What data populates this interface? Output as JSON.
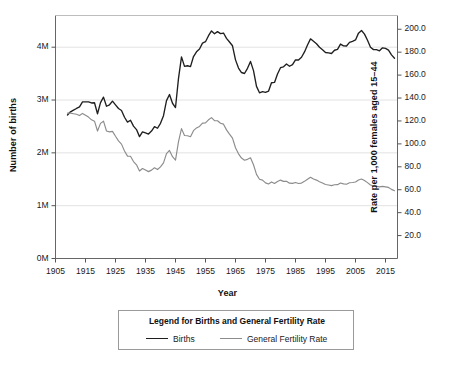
{
  "chart_data": {
    "type": "line",
    "title": "",
    "xlabel": "Year",
    "ylabel": "Number of births",
    "ylabel_right": "Rate per 1,000 females aged 15–44",
    "grid": true,
    "legend_position": "below-plot",
    "legend_title": "Legend for Births and General Fertility Rate",
    "xlim": [
      1905,
      2019
    ],
    "xticks": [
      1905,
      1915,
      1925,
      1935,
      1945,
      1955,
      1965,
      1975,
      1985,
      1995,
      2005,
      2015
    ],
    "xticklabels": [
      "1905",
      "1915",
      "1925",
      "1935",
      "1945",
      "1955",
      "1965",
      "1975",
      "1985",
      "1995",
      "2005",
      "2015"
    ],
    "ylim_left": [
      0,
      4600000
    ],
    "yticks_left": [
      0,
      1000000,
      2000000,
      3000000,
      4000000
    ],
    "yticklabels_left": [
      "0M",
      "1M",
      "2M",
      "3M",
      "4M"
    ],
    "ylim_right": [
      0,
      212
    ],
    "yticks_right": [
      20,
      40,
      60,
      80,
      100,
      120,
      140,
      160,
      180,
      200
    ],
    "yticklabels_right": [
      "20.0",
      "40.0",
      "60.0",
      "80.0",
      "100.0",
      "120.0",
      "140.0",
      "160.0",
      "180.0",
      "200.0"
    ],
    "gridlines_left": [
      1000000,
      2000000,
      3000000,
      4000000
    ],
    "series": [
      {
        "name": "Births",
        "axis": "left",
        "color": "#1f1f1f",
        "x": [
          1909,
          1910,
          1911,
          1912,
          1913,
          1914,
          1915,
          1916,
          1917,
          1918,
          1919,
          1920,
          1921,
          1922,
          1923,
          1924,
          1925,
          1926,
          1927,
          1928,
          1929,
          1930,
          1931,
          1932,
          1933,
          1934,
          1935,
          1936,
          1937,
          1938,
          1939,
          1940,
          1941,
          1942,
          1943,
          1944,
          1945,
          1946,
          1947,
          1948,
          1949,
          1950,
          1951,
          1952,
          1953,
          1954,
          1955,
          1956,
          1957,
          1958,
          1959,
          1960,
          1961,
          1962,
          1963,
          1964,
          1965,
          1966,
          1967,
          1968,
          1969,
          1970,
          1971,
          1972,
          1973,
          1974,
          1975,
          1976,
          1977,
          1978,
          1979,
          1980,
          1981,
          1982,
          1983,
          1984,
          1985,
          1986,
          1987,
          1988,
          1989,
          1990,
          1991,
          1992,
          1993,
          1994,
          1995,
          1996,
          1997,
          1998,
          1999,
          2000,
          2001,
          2002,
          2003,
          2004,
          2005,
          2006,
          2007,
          2008,
          2009,
          2010,
          2011,
          2012,
          2013,
          2014,
          2015,
          2016,
          2017,
          2018
        ],
        "values": [
          2718000,
          2777000,
          2809000,
          2840000,
          2869000,
          2966000,
          2965000,
          2964000,
          2944000,
          2948000,
          2740000,
          2950000,
          3055000,
          2882000,
          2910000,
          2979000,
          2909000,
          2839000,
          2802000,
          2674000,
          2582000,
          2618000,
          2506000,
          2440000,
          2307000,
          2396000,
          2377000,
          2355000,
          2413000,
          2496000,
          2466000,
          2559000,
          2703000,
          2989000,
          3104000,
          2939000,
          2858000,
          3411000,
          3817000,
          3637000,
          3649000,
          3632000,
          3823000,
          3913000,
          3965000,
          4078000,
          4104000,
          4218000,
          4308000,
          4255000,
          4295000,
          4258000,
          4268000,
          4167000,
          4098000,
          4027000,
          3760000,
          3606000,
          3521000,
          3502000,
          3600000,
          3731000,
          3556000,
          3258000,
          3137000,
          3160000,
          3144000,
          3168000,
          3327000,
          3333000,
          3494000,
          3612000,
          3629000,
          3681000,
          3639000,
          3669000,
          3761000,
          3757000,
          3809000,
          3910000,
          4041000,
          4158000,
          4111000,
          4065000,
          4000000,
          3953000,
          3900000,
          3891000,
          3881000,
          3942000,
          3959000,
          4059000,
          4026000,
          4022000,
          4090000,
          4112000,
          4138000,
          4266000,
          4316000,
          4248000,
          4131000,
          3999000,
          3954000,
          3953000,
          3932000,
          3988000,
          3978000,
          3945000,
          3855000,
          3791000
        ]
      },
      {
        "name": "General Fertility Rate",
        "axis": "right",
        "color": "#8c8c8c",
        "x": [
          1909,
          1910,
          1911,
          1912,
          1913,
          1914,
          1915,
          1916,
          1917,
          1918,
          1919,
          1920,
          1921,
          1922,
          1923,
          1924,
          1925,
          1926,
          1927,
          1928,
          1929,
          1930,
          1931,
          1932,
          1933,
          1934,
          1935,
          1936,
          1937,
          1938,
          1939,
          1940,
          1941,
          1942,
          1943,
          1944,
          1945,
          1946,
          1947,
          1948,
          1949,
          1950,
          1951,
          1952,
          1953,
          1954,
          1955,
          1956,
          1957,
          1958,
          1959,
          1960,
          1961,
          1962,
          1963,
          1964,
          1965,
          1966,
          1967,
          1968,
          1969,
          1970,
          1971,
          1972,
          1973,
          1974,
          1975,
          1976,
          1977,
          1978,
          1979,
          1980,
          1981,
          1982,
          1983,
          1984,
          1985,
          1986,
          1987,
          1988,
          1989,
          1990,
          1991,
          1992,
          1993,
          1994,
          1995,
          1996,
          1997,
          1998,
          1999,
          2000,
          2001,
          2002,
          2003,
          2004,
          2005,
          2006,
          2007,
          2008,
          2009,
          2010,
          2011,
          2012,
          2013,
          2014,
          2015,
          2016,
          2017,
          2018
        ],
        "values": [
          126.8,
          126.8,
          126.3,
          125.8,
          124.7,
          126.6,
          125.0,
          123.4,
          121.0,
          119.8,
          111.2,
          117.9,
          119.8,
          111.2,
          110.5,
          110.9,
          106.6,
          102.6,
          99.8,
          93.8,
          89.3,
          89.2,
          84.6,
          81.7,
          76.3,
          78.5,
          77.2,
          75.8,
          77.1,
          79.1,
          77.6,
          79.9,
          83.4,
          91.5,
          94.3,
          88.8,
          85.9,
          101.9,
          113.3,
          107.3,
          107.1,
          106.2,
          111.5,
          113.9,
          115.2,
          118.1,
          118.3,
          121.0,
          122.9,
          120.2,
          120.2,
          118.0,
          117.2,
          112.2,
          108.5,
          105.0,
          96.6,
          91.3,
          87.6,
          85.7,
          86.5,
          87.9,
          81.8,
          73.4,
          69.2,
          68.4,
          66.0,
          65.0,
          66.8,
          65.5,
          67.2,
          68.4,
          67.3,
          67.3,
          65.7,
          65.5,
          66.3,
          65.4,
          65.8,
          67.3,
          69.2,
          70.9,
          69.3,
          68.4,
          67.0,
          65.9,
          64.6,
          64.1,
          63.6,
          64.3,
          64.4,
          65.9,
          65.1,
          64.8,
          66.1,
          66.3,
          66.7,
          68.5,
          69.3,
          68.1,
          66.2,
          64.1,
          63.2,
          63.0,
          62.5,
          62.9,
          62.5,
          62.0,
          60.3,
          59.1
        ]
      }
    ]
  },
  "axes": {
    "left_title": "Number of births",
    "right_title": "Rate per 1,000 females aged 15–44",
    "bottom_title": "Year"
  },
  "legend": {
    "title": "Legend for Births and General Fertility Rate",
    "entries": [
      {
        "label": "Births",
        "color": "#1f1f1f"
      },
      {
        "label": "General Fertility Rate",
        "color": "#8c8c8c"
      }
    ]
  }
}
